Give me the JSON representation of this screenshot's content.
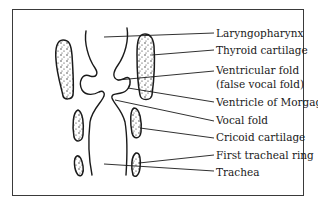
{
  "diagram": {
    "title": "",
    "type": "anatomical-cross-section",
    "labels": [
      {
        "id": "laryngopharynx",
        "text": "Laryngopharynx"
      },
      {
        "id": "thyroid-cartilage",
        "text": "Thyroid cartilage"
      },
      {
        "id": "ventricular-fold",
        "text": "Ventricular fold"
      },
      {
        "id": "ventricular-fold-alt",
        "text": "(false vocal fold)"
      },
      {
        "id": "ventricle-of-morgagni",
        "text": "Ventricle of Morgagni"
      },
      {
        "id": "vocal-fold",
        "text": "Vocal fold"
      },
      {
        "id": "cricoid-cartilage",
        "text": "Cricoid cartilage"
      },
      {
        "id": "first-tracheal-ring",
        "text": "First tracheal ring"
      },
      {
        "id": "trachea",
        "text": "Trachea"
      }
    ]
  }
}
